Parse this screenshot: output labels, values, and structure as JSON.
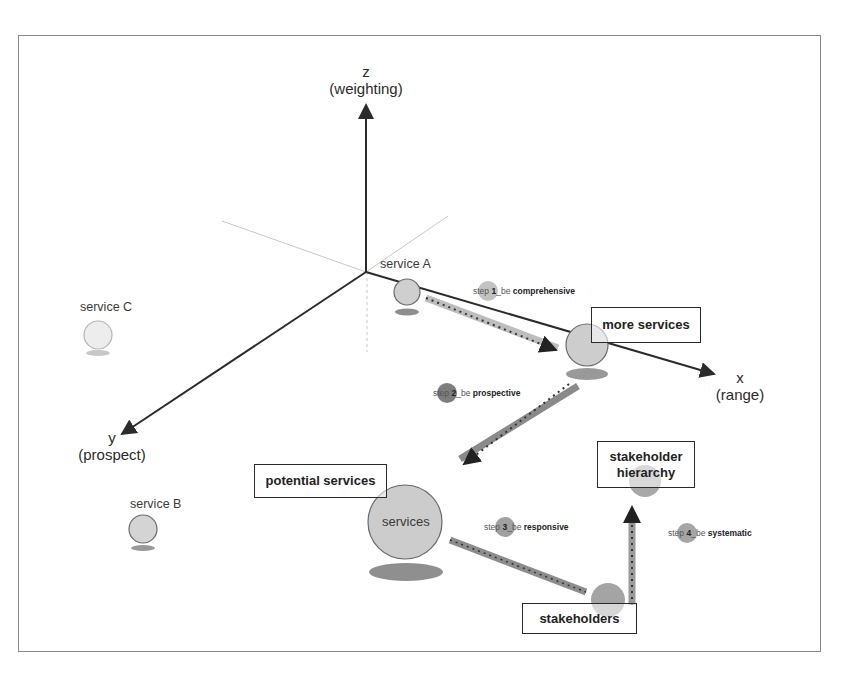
{
  "axes": {
    "z": {
      "letter": "z",
      "name": "(weighting)"
    },
    "x": {
      "letter": "x",
      "name": "(range)"
    },
    "y": {
      "letter": "y",
      "name": "(prospect)"
    }
  },
  "services": {
    "a": "service A",
    "b": "service B",
    "c": "service C",
    "center": "services"
  },
  "boxes": {
    "more_services": "more services",
    "potential_services": "potential services",
    "stakeholder_hierarchy_line1": "stakeholder",
    "stakeholder_hierarchy_line2": "hierarchy",
    "stakeholders": "stakeholders"
  },
  "steps": [
    {
      "prefix": "step ",
      "num": "1",
      "mid": "_be ",
      "word": "comprehensive"
    },
    {
      "prefix": "step ",
      "num": "2",
      "mid": "_be ",
      "word": "prospective"
    },
    {
      "prefix": "step ",
      "num": "3",
      "mid": "_be ",
      "word": "responsive"
    },
    {
      "prefix": "step ",
      "num": "4",
      "mid": "_be ",
      "word": "systematic"
    }
  ],
  "colors": {
    "axis": "#2b2b2b",
    "sphere_light": "#cfcfcf",
    "sphere_mid": "#a9a9a9",
    "shadow": "#9a9a9a",
    "frame": "#8a8a8a"
  }
}
